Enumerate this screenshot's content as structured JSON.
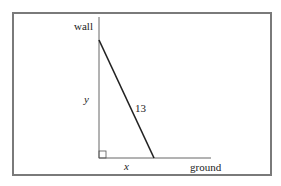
{
  "diagram": {
    "type": "ladder-against-wall right triangle",
    "labels": {
      "wall": "wall",
      "ground": "ground",
      "vertical_side": "y",
      "horizontal_side": "x",
      "hypotenuse": "13"
    },
    "colors": {
      "frame": "#7a7a7a",
      "lines": "#555555",
      "ladder": "#222222",
      "text": "#222222"
    }
  }
}
